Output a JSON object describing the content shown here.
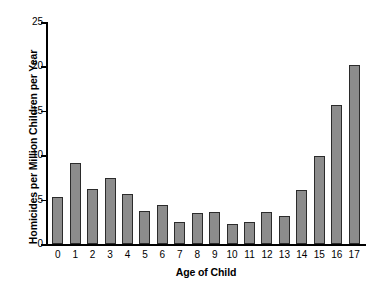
{
  "chart_data": {
    "type": "bar",
    "title": "",
    "xlabel": "Age of Child",
    "ylabel": "Homicides per Million Children per Year",
    "categories": [
      "0",
      "1",
      "2",
      "3",
      "4",
      "5",
      "6",
      "7",
      "8",
      "9",
      "10",
      "11",
      "12",
      "13",
      "14",
      "15",
      "16",
      "17"
    ],
    "values": [
      5.3,
      9.1,
      6.2,
      7.4,
      5.6,
      3.7,
      4.4,
      2.5,
      3.5,
      3.6,
      2.2,
      2.5,
      3.6,
      3.2,
      6.1,
      9.9,
      15.6,
      20.2
    ],
    "ylim": [
      0,
      25
    ],
    "yticks": [
      0,
      5,
      10,
      15,
      20,
      25
    ],
    "ytick_labels": [
      "0",
      "5",
      "10",
      "15",
      "20",
      "25"
    ],
    "grid": false,
    "legend": null,
    "bar_color": "#8c8c8c",
    "bar_edge_color": "#2b2b2b",
    "axis_color": "#000000",
    "background_color": "#ffffff"
  }
}
